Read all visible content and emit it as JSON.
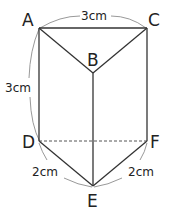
{
  "figure": {
    "type": "triangular prism",
    "vertices": {
      "A": "A",
      "B": "B",
      "C": "C",
      "D": "D",
      "E": "E",
      "F": "F"
    },
    "dimensions": {
      "ac": "3cm",
      "ad": "3cm",
      "de": "2cm",
      "ef": "2cm"
    },
    "colors": {
      "line": "#333333",
      "arc": "#888888",
      "background": "#ffffff"
    }
  }
}
